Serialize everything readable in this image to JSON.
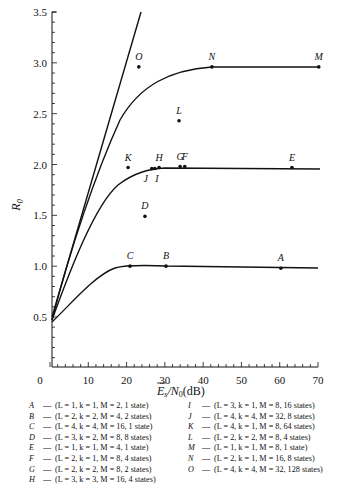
{
  "chart_data": {
    "type": "line",
    "title": "",
    "xlabel": "E̅s/N0(dB)",
    "ylabel": "R0",
    "xlim": [
      0,
      70
    ],
    "ylim": [
      0,
      3.5
    ],
    "x_ticks": [
      "0",
      "10",
      "20",
      "30",
      "40",
      "50",
      "60",
      "70"
    ],
    "y_ticks": [
      "0.5",
      "1.0",
      "1.5",
      "2.0",
      "2.5",
      "3.0",
      "3.5"
    ],
    "grid": false,
    "curves": [
      {
        "name": "steep-line",
        "description": "near-linear rising line from (0,0.5) to (~23,3.5)"
      },
      {
        "name": "saturating-curve-2",
        "description": "rises from (0,0.45) to ~2.0 plateau",
        "plateau": 1.97
      },
      {
        "name": "saturating-curve-3",
        "description": "rises toward ~2.96 plateau",
        "plateau": 2.96
      },
      {
        "name": "saturating-curve-1",
        "description": "rises from (0,0.45) to ~1.0 plateau",
        "plateau": 0.98
      }
    ],
    "points": [
      {
        "label": "A",
        "x": 60.3,
        "y": 0.98
      },
      {
        "label": "B",
        "x": 30.3,
        "y": 1.0
      },
      {
        "label": "C",
        "x": 20.9,
        "y": 1.0
      },
      {
        "label": "D",
        "x": 24.8,
        "y": 1.49
      },
      {
        "label": "E",
        "x": 63.2,
        "y": 1.97
      },
      {
        "label": "F",
        "x": 35.2,
        "y": 1.98
      },
      {
        "label": "G",
        "x": 34.0,
        "y": 1.98
      },
      {
        "label": "H",
        "x": 28.5,
        "y": 1.97
      },
      {
        "label": "I",
        "x": 27.4,
        "y": 1.96
      },
      {
        "label": "J",
        "x": 26.6,
        "y": 1.96
      },
      {
        "label": "K",
        "x": 20.4,
        "y": 1.97
      },
      {
        "label": "L",
        "x": 33.7,
        "y": 2.43
      },
      {
        "label": "M",
        "x": 70.2,
        "y": 2.96
      },
      {
        "label": "N",
        "x": 42.3,
        "y": 2.96
      },
      {
        "label": "O",
        "x": 23.2,
        "y": 2.96
      }
    ]
  },
  "axes": {
    "y_label": "R",
    "y_label_sub": "0",
    "x_label_main": "E",
    "x_label_sub": "s",
    "x_label_rest": "/N",
    "x_label_sub2": "0",
    "x_label_unit": "(dB)"
  },
  "legend": {
    "left": [
      {
        "key": "A",
        "text": "(L = 1,  k = 1,  M = 2, 1 state)"
      },
      {
        "key": "B",
        "text": "(L = 2,  k = 2,  M = 4, 2 states)"
      },
      {
        "key": "C",
        "text": "(L = 4,  k = 4,  M = 16, 1 state)"
      },
      {
        "key": "D",
        "text": "(L = 3,  k = 2,  M = 8, 8 states)"
      },
      {
        "key": "E",
        "text": "(L = 1,  k = 1,  M = 4, 1 state)"
      },
      {
        "key": "F",
        "text": "(L = 2,  k = 1,  M = 8, 4 states)"
      },
      {
        "key": "G",
        "text": "(L = 2,  k = 2,  M = 8, 2 states)"
      },
      {
        "key": "H",
        "text": "(L = 3,  k = 3,  M = 16, 4 states)"
      }
    ],
    "right": [
      {
        "key": "I",
        "text": "(L = 3,  k = 1,  M = 8, 16 states)"
      },
      {
        "key": "J",
        "text": "(L = 4,  k = 4,  M = 32, 8 states)"
      },
      {
        "key": "K",
        "text": "(L = 4,  k = 1,  M = 8, 64 states)"
      },
      {
        "key": "L",
        "text": "(L = 2,  k = 2,  M = 8, 4 states)"
      },
      {
        "key": "M",
        "text": "(L = 1,  k = 1,  M = 8, 1 state)"
      },
      {
        "key": "N",
        "text": "(L = 2,  k = 1,  M = 16, 8 states)"
      },
      {
        "key": "O",
        "text": "(L = 4,  k = 4,  M = 32, 128 states)"
      }
    ],
    "dash": "—"
  }
}
